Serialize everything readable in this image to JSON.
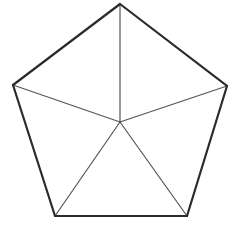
{
  "figure": {
    "shape_name": "pentagon",
    "background_color": "#ffffff",
    "outline_color": "#2b2b2b",
    "spoke_color": "#555555",
    "fill_color": "#ffffff",
    "outline_width": 2.2,
    "spoke_width": 1.2,
    "canvas": {
      "width": 240,
      "height": 226
    },
    "vertices": [
      {
        "name": "apex",
        "label": "A",
        "x": 120,
        "y": 4
      },
      {
        "name": "right",
        "label": "B",
        "x": 227,
        "y": 86
      },
      {
        "name": "bottom-right",
        "label": "C",
        "x": 187,
        "y": 216
      },
      {
        "name": "bottom-left",
        "label": "D",
        "x": 55,
        "y": 216
      },
      {
        "name": "left",
        "label": "E",
        "x": 13,
        "y": 85
      }
    ],
    "center": {
      "name": "center",
      "label": "O",
      "x": 120,
      "y": 122
    },
    "outline_path": "M 120 4 L 227 86 L 187 216 L 55 216 L 13 85 Z",
    "spokes": [
      {
        "name": "spoke-to-apex",
        "x1": 120,
        "y1": 122,
        "x2": 120,
        "y2": 4
      },
      {
        "name": "spoke-to-right",
        "x1": 120,
        "y1": 122,
        "x2": 227,
        "y2": 86
      },
      {
        "name": "spoke-to-bottom-right",
        "x1": 120,
        "y1": 122,
        "x2": 187,
        "y2": 216
      },
      {
        "name": "spoke-to-bottom-left",
        "x1": 120,
        "y1": 122,
        "x2": 55,
        "y2": 216
      },
      {
        "name": "spoke-to-left",
        "x1": 120,
        "y1": 122,
        "x2": 13,
        "y2": 85
      }
    ],
    "triangle_count": 5,
    "side_count": 5
  }
}
